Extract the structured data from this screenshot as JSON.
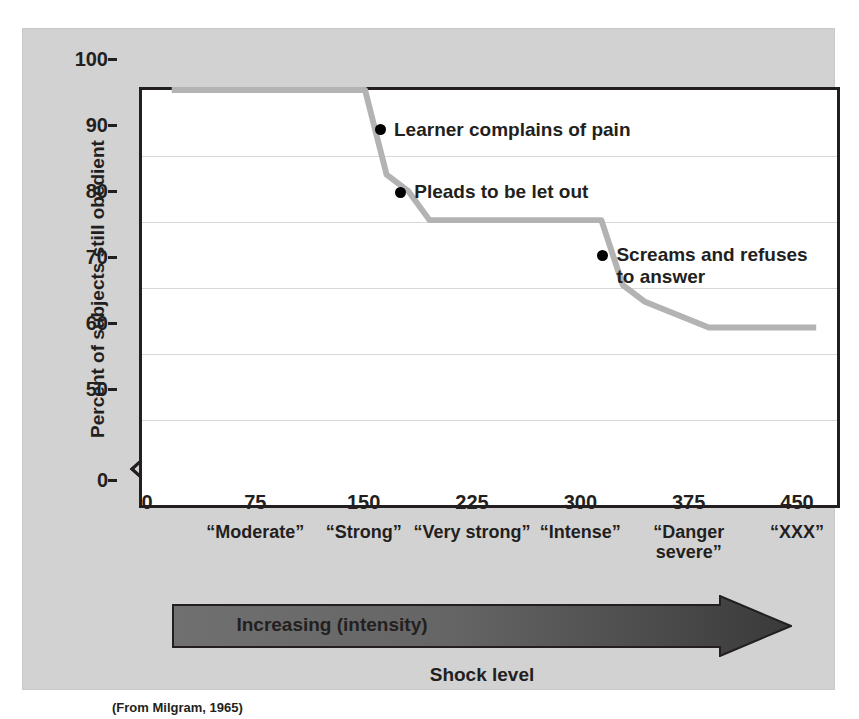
{
  "figure": {
    "panel_color": "#d2d2d2",
    "plot_background": "#ffffff",
    "line_color": "#b3b3b3",
    "axis_color": "#231f20",
    "grid_color": "#d8d8d8",
    "source_note": "(From Milgram, 1965)"
  },
  "axis_break": {
    "name": "y-axis-break",
    "between": [
      0,
      50
    ]
  },
  "arrow": {
    "label": "Increasing (intensity)",
    "caption": "Shock level",
    "gradient_from": "#6e6e6e",
    "gradient_to": "#3b3b3b"
  },
  "chart_data": {
    "type": "line",
    "title": "",
    "subtitle": "",
    "xlabel": "Shock level",
    "ylabel": "Percent of subjects still obedient",
    "xlim": [
      0,
      450
    ],
    "ylim": [
      0,
      100
    ],
    "y_break": [
      0,
      50
    ],
    "grid": true,
    "legend": "none",
    "yticks": [
      {
        "value": 100,
        "label": "100"
      },
      {
        "value": 90,
        "label": "90"
      },
      {
        "value": 80,
        "label": "80"
      },
      {
        "value": 70,
        "label": "70"
      },
      {
        "value": 60,
        "label": "60"
      },
      {
        "value": 50,
        "label": "50"
      },
      {
        "value": 0,
        "label": "0"
      }
    ],
    "xticks": [
      {
        "value": 0,
        "label": "0",
        "descriptor": ""
      },
      {
        "value": 75,
        "label": "75",
        "descriptor": "“Moderate”"
      },
      {
        "value": 150,
        "label": "150",
        "descriptor": "“Strong”"
      },
      {
        "value": 225,
        "label": "225",
        "descriptor": "“Very strong”"
      },
      {
        "value": 300,
        "label": "300",
        "descriptor": "“Intense”"
      },
      {
        "value": 375,
        "label": "375",
        "descriptor": "“Danger\nsevere”"
      },
      {
        "value": 450,
        "label": "450",
        "descriptor": "“XXX”"
      }
    ],
    "series": [
      {
        "name": "Percent of subjects still obedient",
        "color": "#b3b3b3",
        "x": [
          0,
          135,
          150,
          165,
          180,
          300,
          315,
          330,
          375,
          450
        ],
        "values": [
          100,
          100,
          87,
          84.5,
          80,
          80,
          70,
          67.5,
          63.5,
          63.5
        ]
      }
    ],
    "annotations": [
      {
        "text": "Learner complains of pain",
        "x": 144,
        "y": 94,
        "marker": "dot"
      },
      {
        "text": "Pleads to be let out",
        "x": 158,
        "y": 84.5,
        "marker": "dot"
      },
      {
        "text": "Screams and refuses\nto answer",
        "x": 298,
        "y": 75,
        "marker": "dot"
      }
    ]
  }
}
